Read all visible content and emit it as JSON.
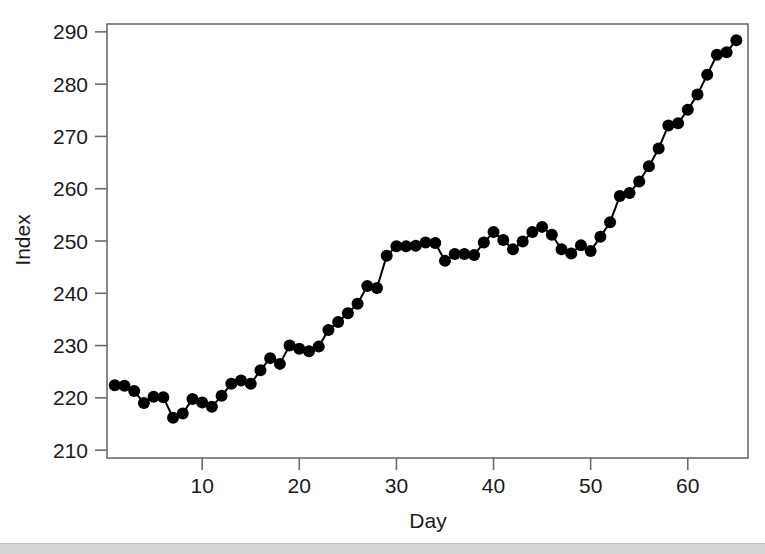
{
  "figure": {
    "background_color": "#ffffff",
    "axis_color": "#6b6b6b",
    "series_color": "#000000",
    "bottom_strip_color": "#d4d4d4"
  },
  "chart_data": {
    "type": "line",
    "title": "",
    "subtitle": "",
    "xlabel": "Day",
    "ylabel": "Index",
    "xlim": [
      0.2,
      66.2
    ],
    "ylim": [
      208.5,
      291.5
    ],
    "xticks": [
      10,
      20,
      30,
      40,
      50,
      60
    ],
    "xtick_labels": [
      "10",
      "20",
      "30",
      "40",
      "50",
      "60"
    ],
    "yticks": [
      210,
      220,
      230,
      240,
      250,
      260,
      270,
      280,
      290
    ],
    "ytick_labels": [
      "210",
      "220",
      "230",
      "240",
      "250",
      "260",
      "270",
      "280",
      "290"
    ],
    "grid": false,
    "legend": null,
    "markers": "filled-circle",
    "marker_size": 6,
    "line_width": 2,
    "x": [
      1,
      2,
      3,
      4,
      5,
      6,
      7,
      8,
      9,
      10,
      11,
      12,
      13,
      14,
      15,
      16,
      17,
      18,
      19,
      20,
      21,
      22,
      23,
      24,
      25,
      26,
      27,
      28,
      29,
      30,
      31,
      32,
      33,
      34,
      35,
      36,
      37,
      38,
      39,
      40,
      41,
      42,
      43,
      44,
      45,
      46,
      47,
      48,
      49,
      50,
      51,
      52,
      53,
      54,
      55,
      56,
      57,
      58,
      59,
      60,
      61,
      62,
      63,
      64,
      65
    ],
    "values": [
      222.4,
      222.3,
      221.3,
      219.0,
      220.2,
      220.1,
      216.2,
      217.0,
      219.8,
      219.1,
      218.3,
      220.4,
      222.7,
      223.3,
      222.7,
      225.3,
      227.6,
      226.5,
      230.0,
      229.4,
      228.9,
      229.8,
      233.0,
      234.5,
      236.2,
      238.0,
      241.4,
      241.0,
      247.2,
      249.0,
      249.0,
      249.1,
      249.7,
      249.6,
      246.2,
      247.5,
      247.5,
      247.3,
      249.7,
      251.7,
      250.2,
      248.4,
      249.9,
      251.7,
      252.7,
      251.2,
      248.4,
      247.6,
      249.2,
      248.1,
      250.8,
      253.6,
      258.6,
      259.2,
      261.4,
      264.3,
      267.7,
      272.1,
      272.5,
      275.1,
      278.0,
      281.8,
      285.6,
      286.1,
      288.4
    ],
    "series": [
      {
        "name": "Index",
        "values": [
          222.4,
          222.3,
          221.3,
          219.0,
          220.2,
          220.1,
          216.2,
          217.0,
          219.8,
          219.1,
          218.3,
          220.4,
          222.7,
          223.3,
          222.7,
          225.3,
          227.6,
          226.5,
          230.0,
          229.4,
          228.9,
          229.8,
          233.0,
          234.5,
          236.2,
          238.0,
          241.4,
          241.0,
          247.2,
          249.0,
          249.0,
          249.1,
          249.7,
          249.6,
          246.2,
          247.5,
          247.5,
          247.3,
          249.7,
          251.7,
          250.2,
          248.4,
          249.9,
          251.7,
          252.7,
          251.2,
          248.4,
          247.6,
          249.2,
          248.1,
          250.8,
          253.6,
          258.6,
          259.2,
          261.4,
          264.3,
          267.7,
          272.1,
          272.5,
          275.1,
          278.0,
          281.8,
          285.6,
          286.1,
          288.4
        ]
      }
    ]
  }
}
